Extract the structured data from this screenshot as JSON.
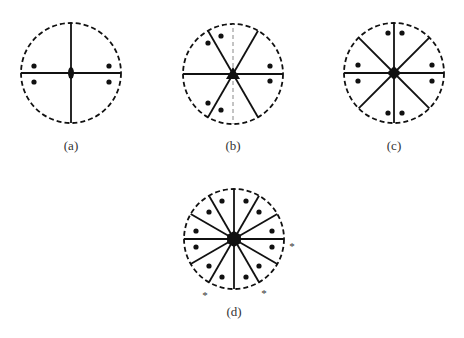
{
  "figure": {
    "panels": [
      {
        "id": "a",
        "label": "(a)",
        "center": [
          71,
          73
        ],
        "radius": 50,
        "label_pos": [
          71,
          146
        ],
        "symmetry_element": "two-fold rotation axis (ellipse)",
        "solid_lines_deg": [
          0,
          90,
          180,
          270
        ],
        "dashed_lines_deg": [],
        "dots": [
          [
            34,
            66
          ],
          [
            34,
            82
          ],
          [
            109,
            66
          ],
          [
            109,
            82
          ]
        ],
        "stars": []
      },
      {
        "id": "b",
        "label": "(b)",
        "center": [
          233,
          74
        ],
        "radius": 50,
        "label_pos": [
          233,
          146
        ],
        "symmetry_element": "three-fold rotation axis (triangle)",
        "solid_lines_deg": [
          0,
          60,
          120,
          180,
          240,
          300
        ],
        "dashed_lines_deg": [
          90,
          270
        ],
        "dots": [
          [
            208,
            43
          ],
          [
            221,
            36
          ],
          [
            270,
            66
          ],
          [
            270,
            81
          ],
          [
            208,
            103
          ],
          [
            221,
            110
          ]
        ],
        "stars": []
      },
      {
        "id": "c",
        "label": "(c)",
        "center": [
          394,
          73
        ],
        "radius": 50,
        "label_pos": [
          394,
          146
        ],
        "symmetry_element": "four-fold rotation axis (square)",
        "solid_lines_deg": [
          0,
          45,
          90,
          135,
          180,
          225,
          270,
          315
        ],
        "dashed_lines_deg": [],
        "dots": [
          [
            388,
            33
          ],
          [
            402,
            33
          ],
          [
            358,
            65
          ],
          [
            358,
            81
          ],
          [
            432,
            65
          ],
          [
            432,
            81
          ],
          [
            388,
            113
          ],
          [
            402,
            113
          ]
        ],
        "stars": []
      },
      {
        "id": "d",
        "label": "(d)",
        "center": [
          234,
          239
        ],
        "radius": 50,
        "label_pos": [
          234,
          312
        ],
        "symmetry_element": "six-fold rotation axis (hexagon)",
        "solid_lines_deg": [
          0,
          30,
          60,
          90,
          120,
          150,
          180,
          210,
          240,
          270,
          300,
          330
        ],
        "dashed_lines_deg": [],
        "dots": [
          [
            222,
            201
          ],
          [
            246,
            201
          ],
          [
            209,
            212
          ],
          [
            259,
            212
          ],
          [
            196,
            231
          ],
          [
            272,
            231
          ],
          [
            196,
            247
          ],
          [
            272,
            247
          ],
          [
            209,
            266
          ],
          [
            259,
            266
          ],
          [
            222,
            277
          ],
          [
            246,
            277
          ]
        ],
        "stars": [
          {
            "text": "*",
            "pos": [
              292,
              246
            ]
          },
          {
            "text": "*",
            "pos": [
              205,
              295
            ]
          },
          {
            "text": "*",
            "pos": [
              264,
              293
            ]
          }
        ]
      }
    ]
  },
  "colors": {
    "stroke": "#111111",
    "dashed_thin": "#888888",
    "label": "#333333",
    "background": "#ffffff"
  }
}
